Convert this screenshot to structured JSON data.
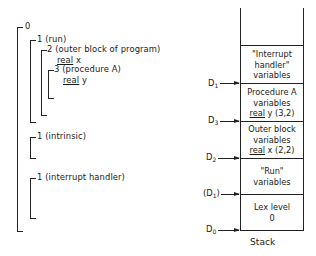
{
  "tree": {
    "level0": {
      "label": "0"
    },
    "run": {
      "label": "1 (run)"
    },
    "outer_block": {
      "label": "2 (outer block of program)",
      "decl_kw": "real",
      "decl_var": " x"
    },
    "procedure_a": {
      "label": "3 (procedure A)",
      "decl_kw": "real",
      "decl_var": " y"
    },
    "intrinsic": {
      "label": "1 (intrinsic)"
    },
    "interrupt_handler": {
      "label": "1 (interrupt handler)"
    }
  },
  "stack": {
    "caption": "Stack",
    "cells": [
      {
        "lines": [
          "\"Interrupt",
          "handler\"",
          "variables"
        ]
      },
      {
        "lines": [
          "Procedure A",
          "variables"
        ],
        "kw": "real",
        "rest": " y  (3,2)"
      },
      {
        "lines": [
          "Outer block",
          "variables"
        ],
        "kw": "real",
        "rest": " x  (2,2)"
      },
      {
        "lines": [
          "\"Run\"",
          "variables"
        ]
      },
      {
        "lines": [
          "Lex level",
          "0"
        ]
      }
    ],
    "pointers": [
      {
        "name": "D",
        "sub": "1",
        "prefix": "",
        "suffix": ""
      },
      {
        "name": "D",
        "sub": "3",
        "prefix": "",
        "suffix": ""
      },
      {
        "name": "D",
        "sub": "2",
        "prefix": "",
        "suffix": ""
      },
      {
        "name": "D",
        "sub": "1",
        "prefix": "(",
        "suffix": ")"
      },
      {
        "name": "D",
        "sub": "0",
        "prefix": "",
        "suffix": ""
      }
    ]
  }
}
